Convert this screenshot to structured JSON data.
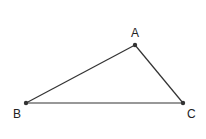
{
  "diagram": {
    "type": "triangle",
    "stroke_color": "#333333",
    "points": [
      {
        "name": "A",
        "x": 135,
        "y": 45,
        "label_x": 131,
        "label_y": 37
      },
      {
        "name": "B",
        "x": 26,
        "y": 103,
        "label_x": 13,
        "label_y": 118
      },
      {
        "name": "C",
        "x": 183,
        "y": 103,
        "label_x": 187,
        "label_y": 118
      }
    ],
    "segments": [
      [
        "A",
        "B"
      ],
      [
        "B",
        "C"
      ],
      [
        "C",
        "A"
      ]
    ]
  }
}
